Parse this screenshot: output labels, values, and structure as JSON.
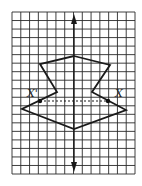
{
  "figure": {
    "type": "reflection-on-grid",
    "grid": {
      "left": 12,
      "top": 12,
      "right": 135,
      "bottom": 174,
      "cols": 14,
      "rows": 19,
      "color": "#2a2a2a"
    },
    "axis_of_reflection": {
      "x": 74,
      "y_top": 14,
      "y_bottom": 172,
      "arrow_top": true,
      "arrow_bottom": true
    },
    "polygon": {
      "stroke": "#2a2a2a",
      "points": [
        [
          74,
          56
        ],
        [
          110,
          65
        ],
        [
          92,
          92
        ],
        [
          126,
          110
        ],
        [
          74,
          129
        ],
        [
          22,
          109
        ],
        [
          57,
          92
        ],
        [
          40,
          64
        ]
      ]
    },
    "segment_xx": {
      "from": [
        40,
        101
      ],
      "to": [
        108,
        101
      ],
      "style": "dashed"
    },
    "points": [
      {
        "name": "X'",
        "at": [
          40,
          101
        ]
      },
      {
        "name": "X",
        "at": [
          108,
          101
        ]
      }
    ],
    "labels": {
      "x_prime": "X'",
      "x": "X"
    }
  }
}
